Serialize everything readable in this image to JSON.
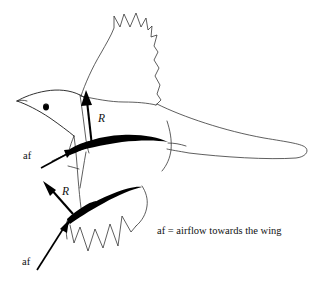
{
  "figure": {
    "background_color": "#ffffff",
    "ink_color": "#000000",
    "width": 319,
    "height": 281
  },
  "labels": {
    "vector_upper_wing": "R",
    "vector_lower_wing": "R",
    "airflow_upper": "af",
    "airflow_lower": "af",
    "caption": "af = airflow towards the wing"
  },
  "parts": {
    "head": "bird-head",
    "eye": "bird-eye",
    "beak": "bird-beak",
    "body": "bird-body",
    "far_wing": "far-wing-raised",
    "near_wing": "near-wing-airfoil",
    "lower_wing": "lower-wing-airfoil",
    "tail": "bird-tail"
  },
  "vectors": [
    {
      "name": "R",
      "meaning": "resultant force on upper wing",
      "from": [
        92,
        146
      ],
      "to": [
        86,
        92
      ],
      "label_at": [
        102,
        117
      ]
    },
    {
      "name": "R",
      "meaning": "resultant force on lower wing",
      "from": [
        73,
        214
      ],
      "to": [
        44,
        182
      ],
      "label_at": [
        66,
        189
      ]
    },
    {
      "name": "af",
      "meaning": "airflow towards the upper wing",
      "from": [
        41,
        168
      ],
      "to": [
        74,
        150
      ],
      "label_at": [
        25,
        156
      ]
    },
    {
      "name": "af",
      "meaning": "airflow towards the lower wing",
      "from": [
        37,
        270
      ],
      "to": [
        69,
        221
      ],
      "label_at": [
        22,
        263
      ]
    }
  ]
}
